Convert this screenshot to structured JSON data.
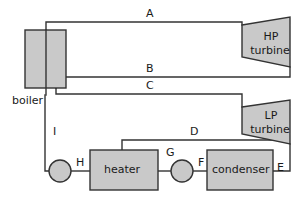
{
  "diagram": {
    "colors": {
      "component_fill": "#c9c9c9",
      "stroke": "#333333",
      "text": "#1a1a1a",
      "background": "#ffffff"
    },
    "components": [
      {
        "id": "boiler",
        "label": "boiler",
        "shape": "rect",
        "x": 25,
        "y": 30,
        "w": 41,
        "h": 58
      },
      {
        "id": "hp-turbine",
        "label": "HP\nturbine",
        "label_line1": "HP",
        "label_line2": "turbine",
        "shape": "trapezoid",
        "x": 242,
        "y": 17,
        "w": 48,
        "h": 50
      },
      {
        "id": "lp-turbine",
        "label": "LP\nturbine",
        "label_line1": "LP",
        "label_line2": "turbine",
        "shape": "trapezoid",
        "x": 242,
        "y": 100,
        "w": 48,
        "h": 44
      },
      {
        "id": "heater",
        "label": "heater",
        "shape": "rect",
        "x": 90,
        "y": 150,
        "w": 68,
        "h": 40
      },
      {
        "id": "condenser",
        "label": "condenser",
        "shape": "rect",
        "x": 207,
        "y": 150,
        "w": 66,
        "h": 40
      },
      {
        "id": "pump-h",
        "label": "",
        "shape": "circle",
        "cx": 60,
        "cy": 171,
        "r": 11
      },
      {
        "id": "pump-g",
        "label": "",
        "shape": "circle",
        "cx": 182,
        "cy": 171,
        "r": 11
      }
    ],
    "streams": [
      {
        "id": "A",
        "label": "A",
        "lx": 146,
        "ly": 8,
        "desc": "boiler outlet to HP turbine inlet"
      },
      {
        "id": "B",
        "label": "B",
        "lx": 146,
        "ly": 63,
        "desc": "HP turbine exhaust back to boiler reheat"
      },
      {
        "id": "C",
        "label": "C",
        "lx": 146,
        "ly": 80,
        "desc": "reheated steam to LP turbine inlet"
      },
      {
        "id": "D",
        "label": "D",
        "lx": 190,
        "ly": 126,
        "desc": "LP turbine extraction steam to feedwater heater"
      },
      {
        "id": "E",
        "label": "E",
        "lx": 277,
        "ly": 162,
        "desc": "LP turbine exhaust to condenser"
      },
      {
        "id": "F",
        "label": "F",
        "lx": 198,
        "ly": 157,
        "desc": "condenser outlet to condensate pump"
      },
      {
        "id": "G",
        "label": "G",
        "lx": 166,
        "ly": 147,
        "desc": "condensate pump discharge to heater"
      },
      {
        "id": "H",
        "label": "H",
        "lx": 76,
        "ly": 157,
        "desc": "heater outlet to feed pump"
      },
      {
        "id": "I",
        "label": "I",
        "lx": 53,
        "ly": 126,
        "desc": "feed pump discharge to boiler"
      }
    ]
  }
}
